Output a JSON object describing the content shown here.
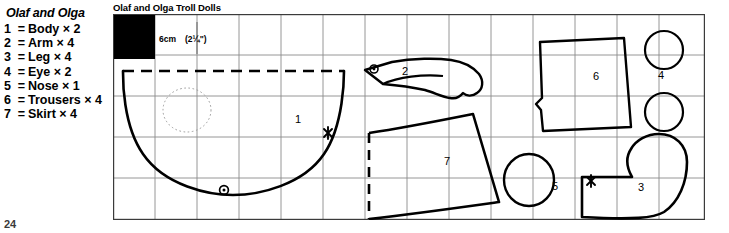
{
  "legend": {
    "title": "Olaf and Olga",
    "items": [
      {
        "num": "1",
        "eq": "=",
        "label": "Body × 2"
      },
      {
        "num": "2",
        "eq": "=",
        "label": "Arm × 4"
      },
      {
        "num": "3",
        "eq": "=",
        "label": "Leg × 4"
      },
      {
        "num": "4",
        "eq": "=",
        "label": "Eye × 2"
      },
      {
        "num": "5",
        "eq": "=",
        "label": "Nose × 1"
      },
      {
        "num": "6",
        "eq": "=",
        "label": "Trousers × 4"
      },
      {
        "num": "7",
        "eq": "=",
        "label": "Skirt × 4"
      }
    ]
  },
  "page_number": "24",
  "panel": {
    "title": "Olaf and Olga Troll Dolls",
    "scale": {
      "metric": "6cm",
      "imperial": "(2¼\")"
    },
    "grid": {
      "columns": 14,
      "rows": 5,
      "cell_px": 42,
      "line_color": "#8a8a8a",
      "border_color": "#3b3b3b"
    },
    "swatch_color": "#000000",
    "piece_labels": [
      {
        "id": "1",
        "text": "1",
        "x": 185,
        "y": 105
      },
      {
        "id": "2",
        "text": "2",
        "x": 292,
        "y": 57
      },
      {
        "id": "3",
        "text": "3",
        "x": 528,
        "y": 173
      },
      {
        "id": "4",
        "text": "4",
        "x": 548,
        "y": 61
      },
      {
        "id": "5",
        "text": "5",
        "x": 442,
        "y": 172
      },
      {
        "id": "6",
        "text": "6",
        "x": 483,
        "y": 62
      },
      {
        "id": "7",
        "text": "7",
        "x": 334,
        "y": 147
      }
    ]
  }
}
